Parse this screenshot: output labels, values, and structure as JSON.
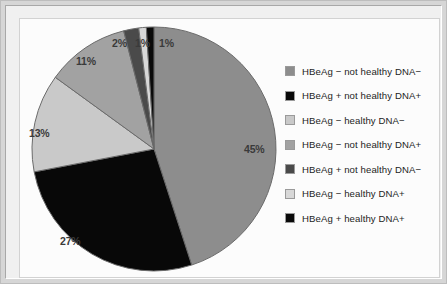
{
  "figure": {
    "background_color": "#fcfcfc",
    "frame_color": "#d6d6d6"
  },
  "chart_data": {
    "type": "pie",
    "title": "",
    "subtitle": "",
    "xlabel": "",
    "ylabel": "",
    "grid": false,
    "legend_position": "right",
    "start_angle_deg": 0,
    "direction": "clockwise",
    "categories": [
      "HBeAg − not healthy DNA−",
      "HBeAg + not healthy DNA+",
      "HBeAg − healthy DNA−",
      "HBeAg − not healthy DNA+",
      "HBeAg + not healthy DNA−",
      "HBeAg − healthy DNA+",
      "HBeAg + healthy DNA+"
    ],
    "values": [
      45,
      27,
      13,
      11,
      2,
      1,
      1
    ],
    "value_labels": [
      "45%",
      "27%",
      "13%",
      "11%",
      "2%",
      "1%",
      "1%"
    ],
    "colors": [
      "#8d8d8d",
      "#080808",
      "#c9c9c9",
      "#a2a2a2",
      "#4a4a4a",
      "#d8d8d8",
      "#0a0a0a"
    ],
    "slice_edge_color": "#6b6b6b"
  },
  "legend": {
    "items": [
      {
        "label": "HBeAg − not healthy DNA−",
        "color": "#8d8d8d"
      },
      {
        "label": "HBeAg + not healthy DNA+",
        "color": "#080808"
      },
      {
        "label": "HBeAg − healthy DNA−",
        "color": "#c9c9c9"
      },
      {
        "label": "HBeAg − not healthy DNA+",
        "color": "#a2a2a2"
      },
      {
        "label": "HBeAg + not healthy DNA−",
        "color": "#4a4a4a"
      },
      {
        "label": "HBeAg − healthy DNA+",
        "color": "#d8d8d8"
      },
      {
        "label": "HBeAg + healthy DNA+",
        "color": "#0a0a0a"
      }
    ]
  },
  "pie_labels": [
    {
      "text": "45%",
      "left": 216,
      "top": 120
    },
    {
      "text": "27%",
      "left": 32,
      "top": 212
    },
    {
      "text": "13%",
      "left": 1,
      "top": 104
    },
    {
      "text": "11%",
      "left": 48,
      "top": 32
    },
    {
      "text": "2%",
      "left": 84,
      "top": 14
    },
    {
      "text": "1%",
      "left": 107,
      "top": 14
    },
    {
      "text": "1%",
      "left": 131,
      "top": 14
    }
  ]
}
